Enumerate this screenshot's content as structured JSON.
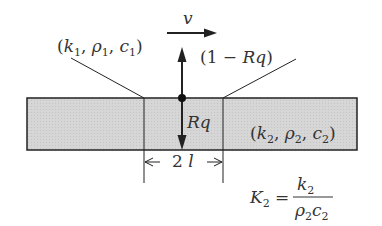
{
  "diagram": {
    "velocity_label": "v",
    "medium1_label": "(k₁, ρ₁, c₁)",
    "medium1": {
      "k": "k",
      "rho": "ρ",
      "c": "c",
      "sub": "1"
    },
    "flux_up_label": "(1 − Rq)",
    "flux_down_label": "Rq",
    "medium2_label": "(k₂, ρ₂, c₂)",
    "medium2": {
      "k": "k",
      "rho": "ρ",
      "c": "c",
      "sub": "2"
    },
    "width_label": "2 l",
    "formula": {
      "lhs": "K",
      "lhs_sub": "2",
      "equals": "=",
      "numerator": "k",
      "numerator_sub": "2",
      "denominator": "ρ₂c₂"
    },
    "colors": {
      "slab_fill": "#d4d4d4",
      "line": "#222222",
      "text": "#333333"
    }
  }
}
